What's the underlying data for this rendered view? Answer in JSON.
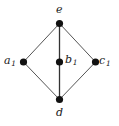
{
  "figure": {
    "type": "graph-diagram",
    "width": 119,
    "height": 126,
    "background_color": "#ffffff",
    "edge_color": "#555555",
    "vertex_color": "#111111",
    "label_color": "#1a1a1a"
  },
  "graph_data": {
    "type": "undirected-graph",
    "description": "Diamond-shaped lattice diagram with a central vertex joined vertically to the top and bottom vertices",
    "vertices": [
      {
        "id": "e",
        "label_base": "e",
        "label_sub": "",
        "x": 59.5,
        "y": 23.5
      },
      {
        "id": "a1",
        "label_base": "a",
        "label_sub": "1",
        "x": 23.5,
        "y": 62.0
      },
      {
        "id": "b1",
        "label_base": "b",
        "label_sub": "1",
        "x": 59.5,
        "y": 62.0
      },
      {
        "id": "c1",
        "label_base": "c",
        "label_sub": "1",
        "x": 95.5,
        "y": 62.0
      },
      {
        "id": "d",
        "label_base": "d",
        "label_sub": "",
        "x": 59.5,
        "y": 99.5
      }
    ],
    "edges": [
      {
        "from": "e",
        "to": "a1"
      },
      {
        "from": "e",
        "to": "c1"
      },
      {
        "from": "e",
        "to": "b1"
      },
      {
        "from": "b1",
        "to": "d"
      },
      {
        "from": "a1",
        "to": "d"
      },
      {
        "from": "c1",
        "to": "d"
      }
    ],
    "labels": {
      "e": "e",
      "a1": "a1",
      "b1": "b1",
      "c1": "c1",
      "d": "d"
    }
  }
}
